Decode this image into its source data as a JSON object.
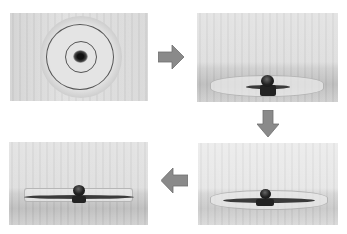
{
  "figure": {
    "flow_order": [
      "top-left",
      "top-right",
      "bottom-right",
      "bottom-left"
    ],
    "panels": [
      {
        "id": "panel-1",
        "position": "top-left",
        "view": "top view",
        "content": "dish with two concentric rings and dark central spot"
      },
      {
        "id": "panel-2",
        "position": "top-right",
        "view": "side view",
        "content": "droplet on dish with small dark film spreading"
      },
      {
        "id": "panel-3",
        "position": "bottom-left",
        "view": "side view",
        "content": "droplet with film spread across full dish"
      },
      {
        "id": "panel-4",
        "position": "bottom-right",
        "view": "side view",
        "content": "droplet with wide dark film layer"
      }
    ],
    "arrows": [
      {
        "id": "arrow-right",
        "direction": "right",
        "from": "panel-1",
        "to": "panel-2"
      },
      {
        "id": "arrow-down",
        "direction": "down",
        "from": "panel-2",
        "to": "panel-4"
      },
      {
        "id": "arrow-left",
        "direction": "left",
        "from": "panel-4",
        "to": "panel-3"
      }
    ],
    "colors": {
      "arrow_fill": "#8a8a8a",
      "arrow_stroke": "#6e6e6e",
      "background": "#ffffff"
    }
  }
}
